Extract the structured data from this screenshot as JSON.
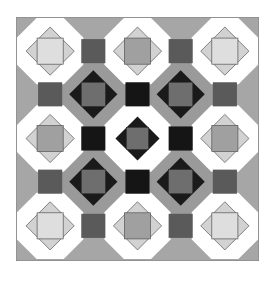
{
  "colors": {
    "background": "#ffffff",
    "field": "#a8a8a8",
    "white_ring": "#ffffff",
    "gray_ring": "#9a9a9a",
    "connector": "#5a5a5a",
    "black_connector": "#151515",
    "light_diamond": "#d2d2d2",
    "light_square": "#a0a0a0",
    "light_square_pale": "#dedede",
    "dark_diamond": "#1a1a1a",
    "dark_square": "#6e6e6e",
    "outline": "#555555"
  },
  "grid": {
    "size": 242,
    "white_centers": [
      34,
      121,
      208
    ],
    "gray_centers": [
      77,
      164
    ],
    "white_radius": 33,
    "gray_radius": 33,
    "connector_half": 12
  }
}
